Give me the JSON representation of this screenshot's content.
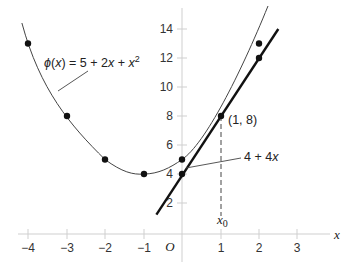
{
  "diagram": {
    "type": "function-plot-with-tangent",
    "axes": {
      "x_label": "x",
      "origin_label": "O",
      "x_ticks": [
        {
          "value": -4,
          "label": "−4"
        },
        {
          "value": -3,
          "label": "−3"
        },
        {
          "value": -2,
          "label": "−2"
        },
        {
          "value": -1,
          "label": "−1"
        },
        {
          "value": 1,
          "label": "1"
        },
        {
          "value": 2,
          "label": "2"
        },
        {
          "value": 3,
          "label": "3"
        }
      ],
      "y_ticks": [
        {
          "value": 2,
          "label": "2"
        },
        {
          "value": 4,
          "label": "4"
        },
        {
          "value": 6,
          "label": "6"
        },
        {
          "value": 8,
          "label": "8"
        },
        {
          "value": 10,
          "label": "10"
        },
        {
          "value": 12,
          "label": "12"
        },
        {
          "value": 14,
          "label": "14"
        }
      ],
      "axis_color": "#d0d0d0"
    },
    "curve": {
      "label_phi": "ϕ(x) = 5 + 2x + x",
      "label_exponent": "2",
      "label_parts": {
        "phi": "ϕ",
        "open": "(",
        "var": "x",
        "rest": ") = 5 + 2",
        "var2": "x",
        "plus": " + ",
        "var3": "x",
        "exp": "2"
      },
      "points": [
        [
          -4,
          13
        ],
        [
          -3,
          8
        ],
        [
          -2,
          5
        ],
        [
          -1,
          4
        ],
        [
          0,
          5
        ],
        [
          2,
          13
        ]
      ],
      "color": "#333333"
    },
    "tangent": {
      "label_parts": {
        "const": "4 + 4",
        "var": "x"
      },
      "points": [
        [
          0,
          4
        ],
        [
          1,
          8
        ],
        [
          2,
          12
        ]
      ],
      "color": "#111111"
    },
    "tangent_point": {
      "label": "(1, 8)"
    },
    "x0_marker": {
      "label_var": "x",
      "label_sub": "0"
    }
  }
}
